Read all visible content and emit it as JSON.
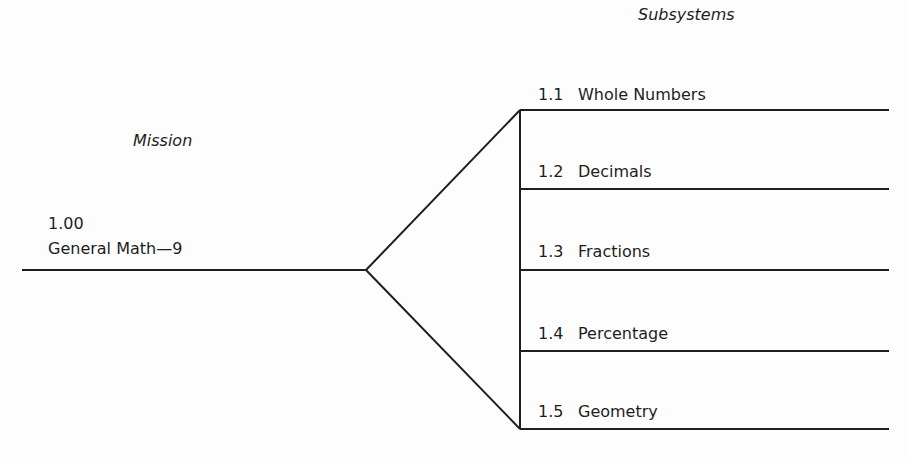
{
  "headers": {
    "mission": "Mission",
    "subsystems": "Subsystems"
  },
  "mission": {
    "number": "1.00",
    "title": "General Math—9"
  },
  "subsystems": [
    {
      "number": "1.1",
      "label": "Whole Numbers"
    },
    {
      "number": "1.2",
      "label": "Decimals"
    },
    {
      "number": "1.3",
      "label": "Fractions"
    },
    {
      "number": "1.4",
      "label": "Percentage"
    },
    {
      "number": "1.5",
      "label": "Geometry"
    }
  ],
  "colors": {
    "line": "#1e1e1e",
    "background": "#fdfdfd"
  }
}
